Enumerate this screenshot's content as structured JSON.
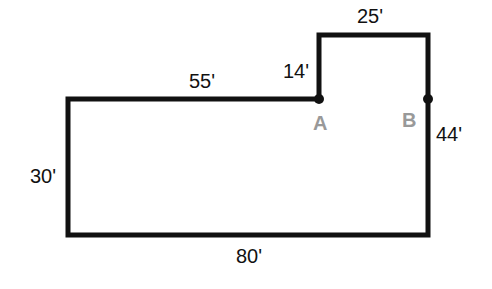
{
  "diagram": {
    "colors": {
      "outline": "#111111",
      "point_label": "#999999",
      "background": "#ffffff"
    },
    "dimensions": {
      "top_notch": "25'",
      "notch_height": "14'",
      "top_left": "55'",
      "right_side": "44'",
      "left_side": "30'",
      "bottom": "80'"
    },
    "points": [
      {
        "label": "A"
      },
      {
        "label": "B"
      }
    ]
  }
}
